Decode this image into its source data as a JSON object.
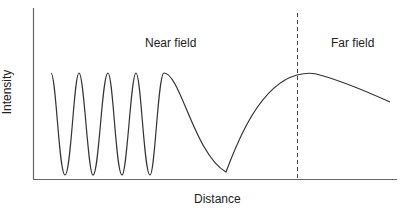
{
  "diagram": {
    "x_axis_label": "Distance",
    "y_axis_label": "Intensity",
    "regions": [
      {
        "name": "near",
        "label": "Near field"
      },
      {
        "name": "far",
        "label": "Far field"
      }
    ],
    "colors": {
      "curve": "#333333",
      "axes": "#555555",
      "divider": "#444444",
      "text": "#222222"
    }
  }
}
